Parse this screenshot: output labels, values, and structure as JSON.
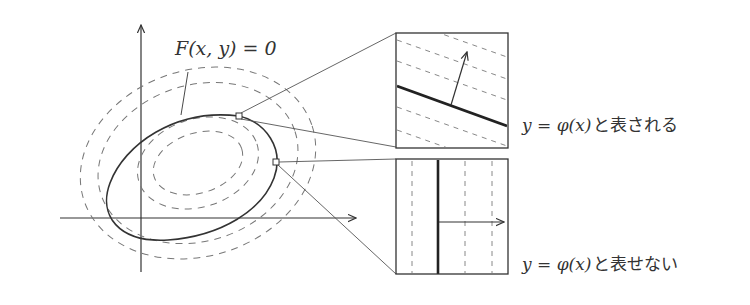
{
  "diagram": {
    "curve_label": "F(x, y) = 0",
    "upper_inset": {
      "caption_math": "y = φ(x)",
      "caption_text": "と表される"
    },
    "lower_inset": {
      "caption_math": "y = φ(x)",
      "caption_text": "と表せない"
    },
    "colors": {
      "stroke": "#333333",
      "dashed": "#777777",
      "background": "#ffffff"
    }
  }
}
